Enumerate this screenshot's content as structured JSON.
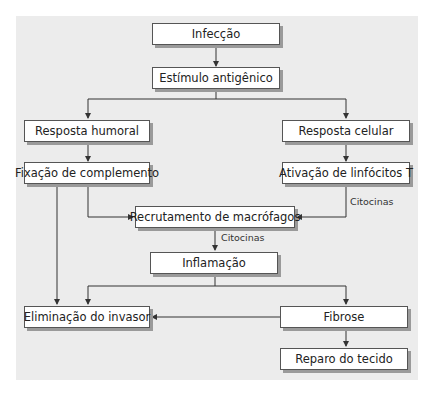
{
  "diagram": {
    "nodes": {
      "infeccao": "Infecção",
      "estimulo": "Estímulo antigênico",
      "humoral": "Resposta humoral",
      "celular": "Resposta celular",
      "fixacao": "Fixação de complemento",
      "ativacao": "Ativação de linfócitos T",
      "recrutamento": "Recrutamento de macrófagos",
      "inflamacao": "Inflamação",
      "eliminacao": "Eliminação do invasor",
      "fibrose": "Fibrose",
      "reparo": "Reparo do tecido"
    },
    "edge_labels": {
      "citocinas_1": "Citocinas",
      "citocinas_2": "Citocinas"
    },
    "colors": {
      "panel_background": "#ececec",
      "box_fill": "#ffffff",
      "box_border": "#555555",
      "box_shadow": "#9a9a9a",
      "line": "#333333"
    }
  }
}
